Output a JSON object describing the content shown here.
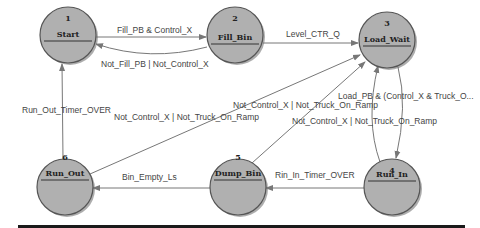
{
  "diagram": {
    "type": "state-machine",
    "nodes": [
      {
        "id": "1",
        "name": "Start",
        "x": 68,
        "y": 35
      },
      {
        "id": "2",
        "name": "Fill_Bin",
        "x": 235,
        "y": 35
      },
      {
        "id": "3",
        "name": "Load_Wait",
        "x": 387,
        "y": 40
      },
      {
        "id": "4",
        "name": "Run_In",
        "x": 392,
        "y": 187
      },
      {
        "id": "5",
        "name": "Dump_Bin",
        "x": 238,
        "y": 187
      },
      {
        "id": "6",
        "name": "Run_Out",
        "x": 65,
        "y": 187
      }
    ],
    "edges": [
      {
        "from": "1",
        "to": "2",
        "label": "Fill_PB & Control_X"
      },
      {
        "from": "2",
        "to": "1",
        "label": "Not_Fill_PB | Not_Control_X"
      },
      {
        "from": "2",
        "to": "3",
        "label": "Level_CTR_Q"
      },
      {
        "from": "3",
        "to": "4",
        "label": "Load_PB & (Control_X & Truck_O..."
      },
      {
        "from": "4",
        "to": "3",
        "label": "Not_Control_X | Not_Truck_On_Ramp"
      },
      {
        "from": "4",
        "to": "5",
        "label": "Rin_In_Timer_OVER"
      },
      {
        "from": "5",
        "to": "3",
        "label": "Not_Control_X | Not_Truck_On_Ramp"
      },
      {
        "from": "5",
        "to": "6",
        "label": "Bin_Empty_Ls"
      },
      {
        "from": "6",
        "to": "3",
        "label": "Not_Control_X | Not_Truck_On_Ramp"
      },
      {
        "from": "6",
        "to": "1",
        "label": "Run_Out_Timer_OVER"
      }
    ],
    "colors": {
      "node_fill": "#b0b0b0",
      "edge": "#777777",
      "bottom_rule": "#1a1a1a"
    }
  }
}
